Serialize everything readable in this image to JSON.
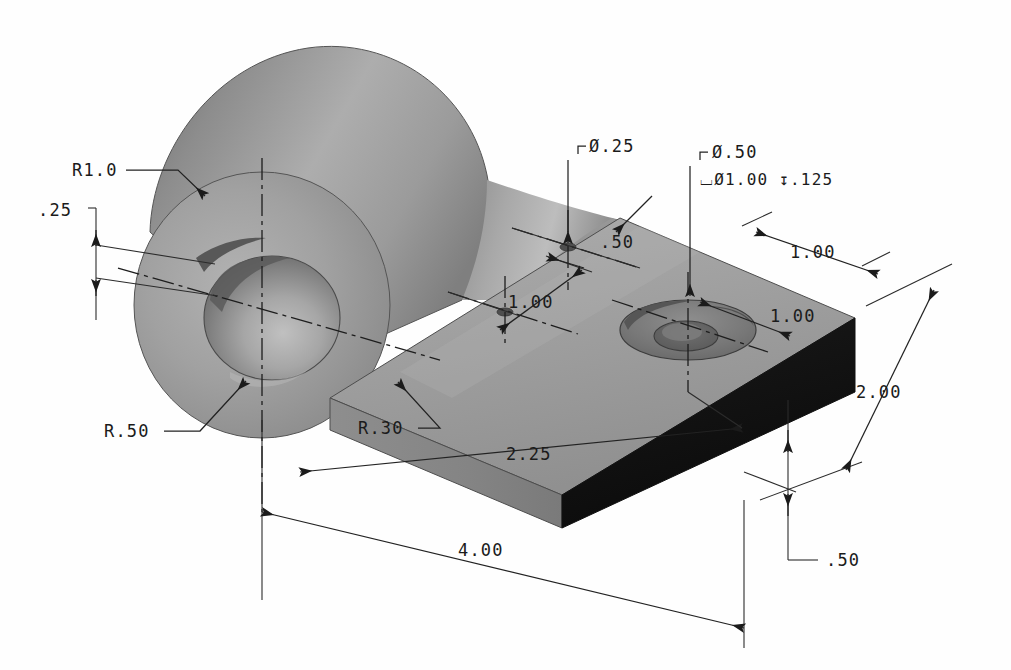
{
  "drawing": {
    "title": "Isometric shaded part drawing",
    "view": "isometric-pictorial",
    "background_color": "#ffffff",
    "line_color": "#1b1b1b"
  },
  "dimensions": {
    "boss_radius": "R1.0",
    "flange_thickness": "0.25",
    "bore_radius": "R.50",
    "fillet_radius": "R.30",
    "small_hole_dia": "Ø.25",
    "cbore_hole_dia": "Ø.50",
    "cbore_callout": "⌴Ø1.00 ↧.125",
    "cbore_dia_value": "Ø1.00",
    "cbore_depth_value": ".125",
    "hole_spacing_across": ".50",
    "hole_spacing_along": "1.00",
    "edge_offset_top": "1.00",
    "edge_offset_side": "1.00",
    "plate_width": "2.00",
    "plate_thickness": ".50",
    "hole_center_from_left": "2.25",
    "overall_length": "4.00"
  },
  "labels": {
    "r1_0": "R1.0",
    "t25": ".25",
    "r50": "R.50",
    "r30": "R.30",
    "dia25": "Ø.25",
    "dia50": "Ø.50",
    "cbore_line": "⌴Ø1.00 ↧.125",
    "d50": ".50",
    "d100_a": "1.00",
    "d100_b": "1.00",
    "d100_c": "1.00",
    "d200": "2.00",
    "d050_thk": ".50",
    "d225": "2.25",
    "d400": "4.00"
  },
  "shading": {
    "boss_top_light": "#b9b9b9",
    "boss_mid": "#9a9a9a",
    "boss_dark": "#6e6e6e",
    "boss_shadow": "#565656",
    "plate_top": "#a3a3a3",
    "plate_top_light": "#b0b0b0",
    "plate_front": "#8a8a8a",
    "plate_end_dark": "#111111",
    "bore_inner": "#7d7d7d",
    "bore_inner_light": "#b5b5b5",
    "cbore_shadow": "#6a6a6a"
  }
}
